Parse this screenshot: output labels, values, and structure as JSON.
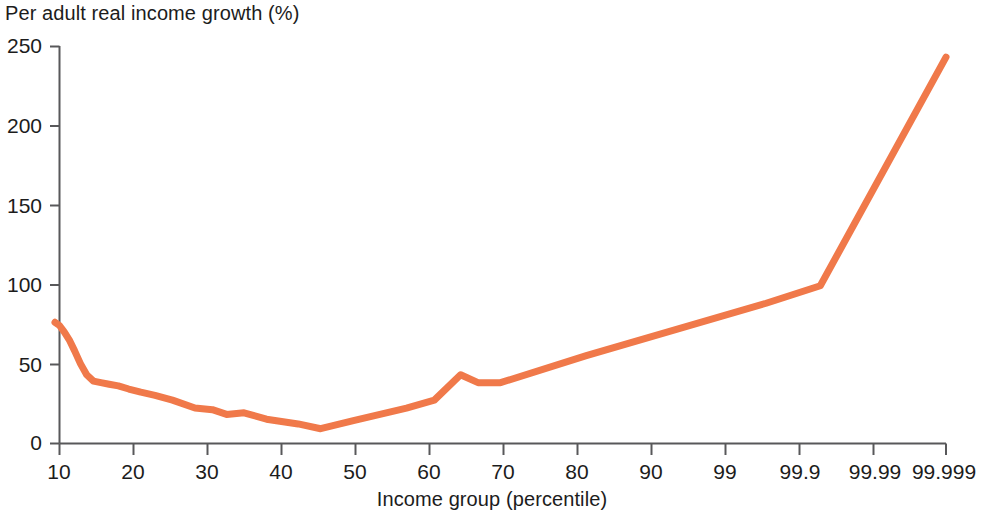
{
  "chart_data": {
    "type": "line",
    "title": "",
    "ylabel": "Per adult real income growth (%)",
    "xlabel": "Income group (percentile)",
    "ylim": [
      0,
      250
    ],
    "y_ticks": [
      0,
      50,
      100,
      150,
      200,
      250
    ],
    "x_tick_labels": [
      "10",
      "20",
      "30",
      "40",
      "50",
      "60",
      "70",
      "80",
      "90",
      "99",
      "99.9",
      "99.99",
      "99.999"
    ],
    "x_scale": "percentile (log of 1-p)",
    "grid": false,
    "legend": null,
    "line_color": "#F0794A",
    "series": [
      {
        "name": "Per adult real income growth",
        "x": [
          "10",
          "15",
          "20",
          "25",
          "30",
          "35",
          "40",
          "45",
          "50",
          "55",
          "60",
          "65",
          "70",
          "75",
          "80",
          "85",
          "88",
          "90",
          "92",
          "94",
          "96",
          "97",
          "98",
          "99",
          "99.3",
          "99.5",
          "99.6",
          "99.7",
          "99.9",
          "99.99",
          "99.995",
          "99.999"
        ],
        "values": [
          76,
          74,
          70,
          65,
          58,
          50,
          43,
          39,
          38,
          37,
          36,
          34,
          32,
          30,
          27,
          22,
          21,
          18,
          19,
          15,
          12,
          9,
          14,
          22,
          27,
          43,
          38,
          38,
          55,
          88,
          99,
          243
        ]
      }
    ],
    "points_px": {
      "note": "traced polyline in source pixel coordinates",
      "x0": 55,
      "x_end": 946,
      "y_zero": 443,
      "y_max": 46
    }
  },
  "axes": {
    "y_tick_labels": [
      "250",
      "200",
      "150",
      "100",
      "50",
      "0"
    ],
    "x_tick_labels": [
      "10",
      "20",
      "30",
      "40",
      "50",
      "60",
      "70",
      "80",
      "90",
      "99",
      "99.9",
      "99.99",
      "99.999"
    ]
  },
  "labels": {
    "y_axis_title": "Per adult real income growth (%)",
    "x_axis_title": "Income group (percentile)"
  },
  "colors": {
    "line": "#F0794A",
    "axis": "#58585a",
    "text": "#1c1c1c",
    "background": "#ffffff"
  }
}
